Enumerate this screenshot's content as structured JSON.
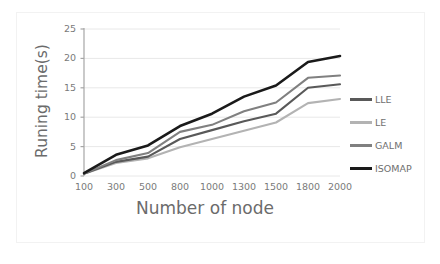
{
  "chart_data": {
    "type": "line",
    "title": "",
    "xlabel": "Number of node",
    "ylabel": "Runing time(s)",
    "categories": [
      "100",
      "300",
      "500",
      "800",
      "1000",
      "1300",
      "1500",
      "1800",
      "2000"
    ],
    "ylim": [
      0,
      25
    ],
    "yticks": [
      "0",
      "5",
      "10",
      "15",
      "20",
      "25"
    ],
    "grid": true,
    "legend_position": "right",
    "series": [
      {
        "name": "LLE",
        "color": "#595959",
        "values": [
          0.4,
          2.4,
          3.3,
          6.3,
          7.8,
          9.3,
          10.6,
          15.0,
          15.6
        ]
      },
      {
        "name": "LE",
        "color": "#b3b3b3",
        "values": [
          0.4,
          2.2,
          3.0,
          4.9,
          6.3,
          7.7,
          9.1,
          12.4,
          13.1
        ]
      },
      {
        "name": "GALM",
        "color": "#808080",
        "values": [
          0.4,
          2.7,
          3.9,
          7.5,
          8.7,
          11.0,
          12.5,
          16.7,
          17.1
        ]
      },
      {
        "name": "ISOMAP",
        "color": "#1a1a1a",
        "values": [
          0.5,
          3.6,
          5.2,
          8.5,
          10.6,
          13.5,
          15.4,
          19.4,
          20.4
        ]
      }
    ]
  },
  "colors": {
    "axis": "#a6a6a6",
    "grid": "#e8e8e8",
    "tick_text": "#7a7a7a",
    "title_text": "#6b6b6b",
    "frame": "#f2f2f2",
    "background": "#ffffff"
  }
}
